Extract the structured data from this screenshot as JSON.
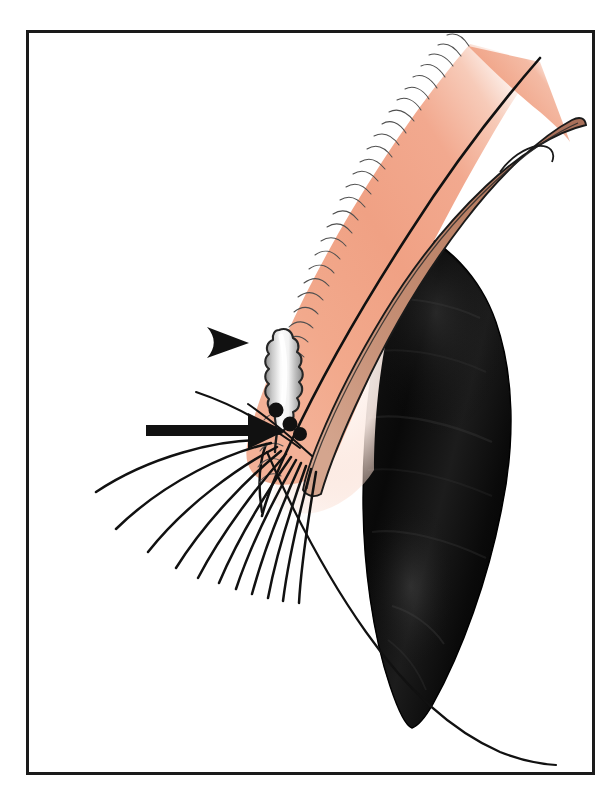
{
  "figure": {
    "domain": "anatomical-illustration",
    "caption": "",
    "canvas": {
      "width": 614,
      "height": 795,
      "background": "#ffffff"
    }
  },
  "frame": {
    "name": "figure-border",
    "x": 26,
    "y": 30,
    "width": 569,
    "height": 745,
    "stroke_color": "#1a1a1a",
    "stroke_width": 3,
    "fill": "#ffffff"
  },
  "palette": {
    "skin_pink": "#F0A384",
    "skin_pink_light": "#F6C3AE",
    "skin_pale": "#FBE4DA",
    "tarsal_brown": "#C08970",
    "tarsal_brown_dark": "#A9705A",
    "globe_black": "#0B0B0B",
    "globe_black_soft": "#2A2A2A",
    "gland_white": "#FAFAFA",
    "gland_gray": "#9C9C9C",
    "ink": "#111111",
    "white": "#FFFFFF"
  },
  "structures": [
    {
      "id": "conjunctival-lid-body",
      "label": "Palpebral conjunctiva / lid body",
      "fill": "skin_pink",
      "outline": "#111111",
      "note": "Large curved salmon-pink band sweeping from upper right down to the lid margin at lower left"
    },
    {
      "id": "tarsal-plate-band",
      "label": "Tarsal plate band",
      "fill": "tarsal_brown",
      "outline": "#111111",
      "note": "Tan-brown elongated band running parallel inside the pink lid, ending in a rounded tip upper right"
    },
    {
      "id": "globe-cornea",
      "label": "Globe / cornea in shadow",
      "fill": "globe_black",
      "outline": "#000000",
      "note": "Large black tapering form occupying the right half, pointed at the lower end"
    },
    {
      "id": "meibomian-gland",
      "label": "Meibomian gland (lobulated acini)",
      "fill": "gland_white",
      "outline": "#2a2a2a",
      "lobe_count": 7,
      "note": "Vertical lobulated gland with white-to-gray gradient interior, duct descending to orifice"
    },
    {
      "id": "gland-orifices",
      "label": "Meibomian gland orifices",
      "fill": "ink",
      "count": 3,
      "note": "Three black dots in a descending diagonal along the lid margin"
    },
    {
      "id": "cut-edge-hatching",
      "label": "Cut-edge hatching on lid skin surface",
      "stroke": "#4a4a4a",
      "count": 40,
      "note": "Fine hairline hatch marks along the outer convex border of the pink lid"
    },
    {
      "id": "eyelashes",
      "label": "Eyelashes",
      "stroke": "ink",
      "count": 11,
      "note": "Long curved lashes fanning down and to the left from the lash line"
    },
    {
      "id": "lid-margin-sweep",
      "label": "Lower lid margin sweep line",
      "stroke": "ink",
      "note": "Long thin curve passing from the lash root down beneath the black globe tip to the lower right"
    }
  ],
  "annotations": [
    {
      "id": "arrowhead-marker",
      "name": "arrowhead-marker",
      "type": "arrowhead",
      "points_to": "gray-line-mucocutaneous-junction",
      "label": "",
      "tip_x": 246,
      "tip_y": 342,
      "color": "#111111",
      "direction": "right"
    },
    {
      "id": "solid-arrow-marker",
      "name": "solid-arrow-marker",
      "type": "arrow",
      "points_to": "lash-line-and-gland-orifices",
      "label": "",
      "tail_x": 146,
      "tail_y": 431,
      "tip_x": 281,
      "tip_y": 431,
      "color": "#111111",
      "direction": "right"
    }
  ]
}
